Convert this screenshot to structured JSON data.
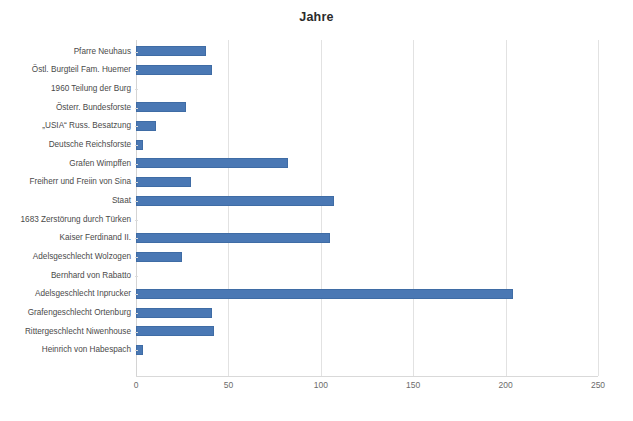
{
  "chart_data": {
    "type": "bar",
    "orientation": "horizontal",
    "title": "Jahre",
    "xlabel": "",
    "ylabel": "",
    "xlim": [
      0,
      250
    ],
    "xticks": [
      0,
      50,
      100,
      150,
      200,
      250
    ],
    "grid": true,
    "legend": "none",
    "series_color": "#4a78b4",
    "categories": [
      "Pfarre Neuhaus",
      "Östl. Burgteil Fam. Huemer",
      "1960 Teilung der Burg",
      "Österr. Bundesforste",
      "„USIA“ Russ. Besatzung",
      "Deutsche Reichsforste",
      "Grafen Wimpffen",
      "Freiherr und Freiin von Sina",
      "Staat",
      "1683 Zerstörung durch Türken",
      "Kaiser Ferdinand II.",
      "Adelsgeschlecht Wolzogen",
      "Bernhard von Rabatto",
      "Adelsgeschlecht Inprucker",
      "Grafengeschlecht Ortenburg",
      "Rittergeschlecht Niwenhouse",
      "Heinrich von Habespach"
    ],
    "values": [
      38,
      41,
      0,
      27,
      11,
      4,
      82,
      30,
      107,
      0,
      105,
      25,
      0,
      204,
      41,
      42,
      4
    ]
  }
}
